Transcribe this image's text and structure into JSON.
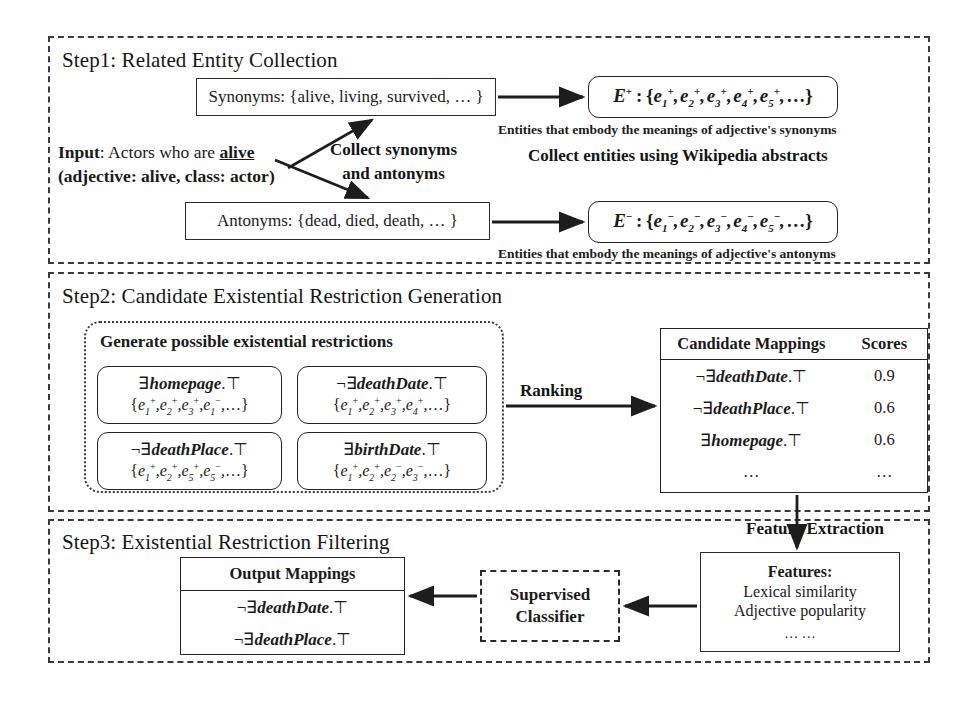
{
  "step1": {
    "title": "Step1: Related Entity Collection",
    "input": {
      "line1_label": "Input",
      "line1_rest": ": Actors who are ",
      "line1_adjective": "alive",
      "line2": "(adjective: alive, class: actor)"
    },
    "arrow_label": "Collect synonyms\nand antonyms",
    "arrow_label_line1": "Collect synonyms",
    "arrow_label_line2": "and antonyms",
    "wiki_label": "Collect entities using Wikipedia abstracts",
    "synonyms_box": "Synonyms: {alive, living,  survived, … }",
    "antonyms_box": "Antonyms: {dead, died, death, … }",
    "eplus": {
      "symbol": "E",
      "superscript": "+",
      "set": "{e1+, e2+, e3+, e4+, e5+, …}"
    },
    "eminus": {
      "symbol": "E",
      "superscript": "−",
      "set": "{e1−, e2−, e3−, e4−, e5−, …}"
    },
    "caption_plus": "Entities that embody the meanings of adjective's synonyms",
    "caption_minus": "Entities that embody the meanings of adjective's antonyms"
  },
  "step2": {
    "title": "Step2: Candidate Existential Restriction Generation",
    "generate_label": "Generate possible existential restrictions",
    "ranking_label": "Ranking",
    "restrictions": [
      {
        "name": "homepage",
        "negated": false,
        "entities": "{e1+, e2+, e3+, e1−, …}"
      },
      {
        "name": "deathDate",
        "negated": true,
        "entities": "{e1+, e2+, e3+, e4+, …}"
      },
      {
        "name": "deathPlace",
        "negated": true,
        "entities": "{e1+, e2+, e5+, e5−, …}"
      },
      {
        "name": "birthDate",
        "negated": false,
        "entities": "{e1+, e2+, e2−, e3−, …}"
      }
    ],
    "table": {
      "headers": [
        "Candidate Mappings",
        "Scores"
      ],
      "rows": [
        {
          "mapping": "¬∃deathDate.⊤",
          "name": "deathDate",
          "negated": true,
          "score": "0.9"
        },
        {
          "mapping": "¬∃deathPlace.⊤",
          "name": "deathPlace",
          "negated": true,
          "score": "0.6"
        },
        {
          "mapping": "∃homepage.⊤",
          "name": "homepage",
          "negated": false,
          "score": "0.6"
        },
        {
          "mapping": "…",
          "name": "",
          "negated": false,
          "score": "…"
        }
      ]
    }
  },
  "step3": {
    "title": "Step3: Existential Restriction Filtering",
    "feature_extraction_label": "Feature Extraction",
    "output_table": {
      "header": "Output Mappings",
      "rows": [
        {
          "mapping": "¬∃deathDate.⊤",
          "name": "deathDate",
          "negated": true
        },
        {
          "mapping": "¬∃deathPlace.⊤",
          "name": "deathPlace",
          "negated": true
        }
      ]
    },
    "classifier": {
      "line1": "Supervised",
      "line2": "Classifier"
    },
    "features": {
      "title": "Features:",
      "items": [
        "Lexical similarity",
        "Adjective popularity",
        "… …"
      ]
    }
  },
  "colors": {
    "ink": "#1a1a1a",
    "panel_border": "#3a3a3a",
    "box_border": "#232323",
    "background": "#ffffff"
  }
}
